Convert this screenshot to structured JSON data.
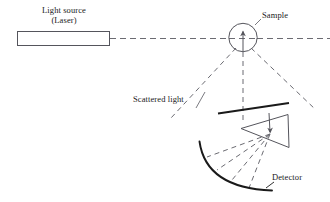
{
  "figure": {
    "type": "optical-schematic",
    "background_color": "#ffffff",
    "stroke_color": "#3f3f46",
    "solid_color": "#1a1a1a",
    "labels": {
      "light_source": "Light source",
      "light_source_sub": "(Laser)",
      "sample": "Sample",
      "scattered_light": "Scattered light",
      "detector": "Detector"
    },
    "components": [
      {
        "name": "laser-box",
        "label": "Light source (Laser)",
        "shape": "rectangle"
      },
      {
        "name": "incident-beam",
        "label": "incident beam",
        "shape": "dashed-line"
      },
      {
        "name": "sample-circle",
        "label": "Sample",
        "shape": "circle"
      },
      {
        "name": "sample-arrow",
        "label": "beam into sample",
        "shape": "arrow"
      },
      {
        "name": "scattered-rays",
        "label": "Scattered light",
        "shape": "dashed-rays"
      },
      {
        "name": "lens-bar",
        "label": "collecting lens",
        "shape": "thick-line"
      },
      {
        "name": "prism",
        "label": "prism",
        "shape": "triangle"
      },
      {
        "name": "detector-arc",
        "label": "Detector",
        "shape": "arc"
      }
    ]
  }
}
